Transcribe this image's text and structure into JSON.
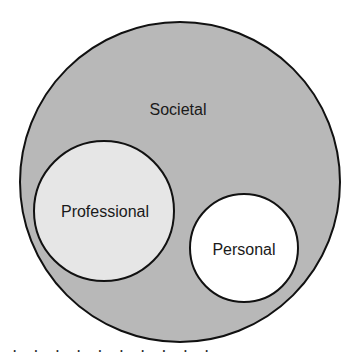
{
  "diagram": {
    "type": "nested-circles",
    "circles": [
      {
        "id": "societal",
        "label": "Societal",
        "fill": "#b8b8b8",
        "stroke": "#111111",
        "cx": 180,
        "cy": 182,
        "r": 160,
        "label_x": 178,
        "label_y": 115
      },
      {
        "id": "professional",
        "label": "Professional",
        "fill": "#e6e6e6",
        "stroke": "#111111",
        "cx": 104,
        "cy": 211,
        "r": 70,
        "label_x": 105,
        "label_y": 217
      },
      {
        "id": "personal",
        "label": "Personal",
        "fill": "#ffffff",
        "stroke": "#111111",
        "cx": 244,
        "cy": 248,
        "r": 54,
        "label_x": 244,
        "label_y": 255
      }
    ]
  },
  "caption_fragment": "· · · · · · · · · ·"
}
